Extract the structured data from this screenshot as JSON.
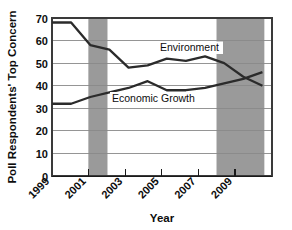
{
  "chart_data": {
    "type": "line",
    "title": "",
    "subtitle": "",
    "xlabel": "Year",
    "ylabel": "Poll Respondents' Top Concern",
    "x": [
      1999,
      2000,
      2001,
      2002,
      2003,
      2004,
      2005,
      2006,
      2007,
      2008,
      2009,
      2010
    ],
    "xlim": [
      1999,
      2010.5
    ],
    "ylim": [
      0,
      70
    ],
    "yticks": [
      0,
      10,
      20,
      30,
      40,
      50,
      60,
      70
    ],
    "ytick_labels": [
      "0",
      "10",
      "20",
      "30",
      "40",
      "50",
      "60",
      "70"
    ],
    "xticks": [
      1999,
      2001,
      2003,
      2005,
      2007,
      2009
    ],
    "xtick_labels": [
      "1999",
      "2001",
      "2003",
      "2005",
      "2007",
      "2009"
    ],
    "grid": true,
    "grid_axis": "y",
    "legend_position": "inline-annotation",
    "series": [
      {
        "name": "Environment",
        "label": "Environment",
        "color": "#2b2b2b",
        "values": [
          68,
          68,
          58,
          56,
          48,
          49,
          52,
          51,
          53,
          50,
          44,
          40
        ]
      },
      {
        "name": "Economic Growth",
        "label": "Economic Growth",
        "color": "#2b2b2b",
        "values": [
          32,
          32,
          35,
          37,
          39,
          42,
          38,
          38,
          39,
          41,
          43,
          46
        ]
      }
    ],
    "annotations": [
      {
        "text": "Environment",
        "x": 2005.6,
        "y": 57.5
      },
      {
        "text": "Economic Growth",
        "x": 2003.2,
        "y": 33.5
      }
    ],
    "shaded_regions": [
      {
        "name": "recession-2001",
        "x_start": 2000.9,
        "x_end": 2001.9,
        "color": "#9a9a9a"
      },
      {
        "name": "recession-2008",
        "x_start": 2007.6,
        "x_end": 2010.1,
        "color": "#9a9a9a"
      }
    ]
  }
}
